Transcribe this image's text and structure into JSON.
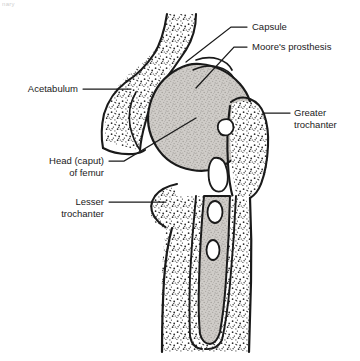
{
  "figure": {
    "kind": "anatomical-line-drawing",
    "scan_fragment": "nary",
    "colors": {
      "ink": "#1a1a1a",
      "background": "#ffffff",
      "bone_fill": "#ffffff",
      "cancellous_stipple": "#3a3a3a",
      "prosthesis_fill": "#c9c6c2"
    },
    "labels": [
      {
        "id": "capsule",
        "text": "Capsule",
        "line2": "",
        "x": 252,
        "y": 30,
        "anchor": "start"
      },
      {
        "id": "moores",
        "text": "Moore's prosthesis",
        "line2": "",
        "x": 252,
        "y": 50,
        "anchor": "start"
      },
      {
        "id": "greater",
        "text": "Greater",
        "line2": "trochanter",
        "x": 294,
        "y": 116,
        "anchor": "start"
      },
      {
        "id": "acetabulum",
        "text": "Acetabulum",
        "line2": "",
        "x": 78,
        "y": 92,
        "anchor": "end"
      },
      {
        "id": "head-of-femur",
        "text": "Head (caput)",
        "line2": "of femur",
        "x": 104,
        "y": 164,
        "anchor": "end"
      },
      {
        "id": "lesser",
        "text": "Lesser",
        "line2": "trochanter",
        "x": 104,
        "y": 205,
        "anchor": "end"
      }
    ],
    "leaders": [
      {
        "id": "leader-capsule",
        "d": "M 247 27  L 231 27  L 186 62"
      },
      {
        "id": "leader-moores",
        "d": "M 247 47  L 234 47  L 196 88"
      },
      {
        "id": "leader-greater",
        "d": "M 290 113 L 263 113"
      },
      {
        "id": "leader-acetabulum",
        "d": "M 83 89   L 131 89"
      },
      {
        "id": "leader-head",
        "d": "M 109 161 L 124 161 L 196 118"
      },
      {
        "id": "leader-lesser",
        "d": "M 109 202 L 166 202"
      }
    ]
  }
}
